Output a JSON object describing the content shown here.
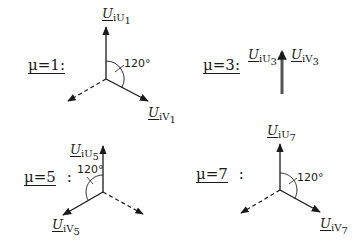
{
  "diagrams": [
    {
      "mu_label": "μ=1",
      "colon": ":",
      "vectors": [
        {
          "symbol": "U",
          "subscript": "iU",
          "index": "1",
          "direction": "up",
          "style": "solid"
        },
        {
          "symbol": "U",
          "subscript": "iV",
          "index": "1",
          "direction": "down-right",
          "style": "solid"
        },
        {
          "direction": "down-left",
          "style": "dashed"
        }
      ],
      "angle_label": "120°"
    },
    {
      "mu_label": "μ=3",
      "colon": ":",
      "vectors": [
        {
          "symbol": "U",
          "subscript": "iU",
          "index": "3",
          "direction": "up",
          "style": "solid-thick"
        },
        {
          "symbol": "U",
          "subscript": "iV",
          "index": "3",
          "direction": "up",
          "style": "solid-thick"
        }
      ]
    },
    {
      "mu_label": "μ=5",
      "colon": ":",
      "vectors": [
        {
          "symbol": "U",
          "subscript": "iU",
          "index": "5",
          "direction": "up",
          "style": "solid"
        },
        {
          "symbol": "U",
          "subscript": "iV",
          "index": "5",
          "direction": "down-left",
          "style": "solid"
        },
        {
          "direction": "down-right",
          "style": "dashed"
        }
      ],
      "angle_label": "120°"
    },
    {
      "mu_label": "μ=7",
      "colon": ":",
      "vectors": [
        {
          "symbol": "U",
          "subscript": "iU",
          "index": "7",
          "direction": "up",
          "style": "solid"
        },
        {
          "symbol": "U",
          "subscript": "iV",
          "index": "7",
          "direction": "down-right",
          "style": "solid"
        },
        {
          "direction": "down-left",
          "style": "dashed"
        }
      ],
      "angle_label": "120°"
    }
  ],
  "colors": {
    "line": "#1a1a1a",
    "thick_arrow": "#555555"
  }
}
